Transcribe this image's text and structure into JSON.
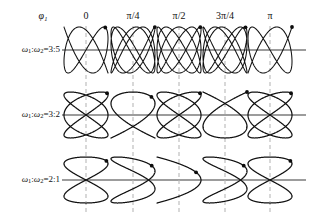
{
  "plate": {
    "title": "Lissajous figures for varying frequency ratio and phase",
    "width": 314,
    "height": 218,
    "background": "#ffffff",
    "curve_color": "#111111",
    "axis_color": "#3b3b3b",
    "dash_color": "#b9b9b9"
  },
  "header": {
    "phase_symbol": "φ",
    "phase_subscript": "1",
    "columns": [
      {
        "label": "0",
        "phase_rad": 0.0
      },
      {
        "label": "π/4",
        "phase_rad": 0.7853981634
      },
      {
        "label": "π/2",
        "phase_rad": 1.5707963268
      },
      {
        "label": "3π/4",
        "phase_rad": 2.3561944902
      },
      {
        "label": "π",
        "phase_rad": 3.1415926536
      }
    ]
  },
  "rows": [
    {
      "omega_symbol": "ω",
      "sub1": "1",
      "sep": ":",
      "sub2": "2",
      "eq": "=",
      "ratio_label": "3:5",
      "ratio": [
        3,
        5
      ],
      "label_full": "ω₁:ω₂=3:5"
    },
    {
      "omega_symbol": "ω",
      "sub1": "1",
      "sep": ":",
      "sub2": "2",
      "eq": "=",
      "ratio_label": "3:2",
      "ratio": [
        3,
        2
      ],
      "label_full": "ω₁:ω₂=3:2"
    },
    {
      "omega_symbol": "ω",
      "sub1": "1",
      "sep": ":",
      "sub2": "2",
      "eq": "=",
      "ratio_label": "2:1",
      "ratio": [
        2,
        1
      ],
      "label_full": "ω₁:ω₂=2:1"
    }
  ],
  "chart_data": {
    "type": "line",
    "xlabel": "φ₁",
    "ylabel": "ω₁:ω₂",
    "grid": false,
    "legend": "none",
    "parametric": {
      "x": "A·sin(ω₁ t + φ₁)",
      "y": "B·sin(ω₂ t)",
      "t_range": [
        0,
        6.283185307
      ]
    },
    "columns": [
      "0",
      "π/4",
      "π/2",
      "3π/4",
      "π"
    ],
    "column_phases": [
      0.0,
      0.7853981634,
      1.5707963268,
      2.3561944902,
      3.1415926536
    ],
    "row_ratios": [
      "3:5",
      "3:2",
      "2:1"
    ],
    "cells": [
      {
        "row": "3:5",
        "col": "0",
        "wx": 3,
        "wy": 5,
        "phase": 0.0,
        "start_marker": true
      },
      {
        "row": "3:5",
        "col": "π/4",
        "wx": 3,
        "wy": 5,
        "phase": 0.7853981634,
        "start_marker": true
      },
      {
        "row": "3:5",
        "col": "π/2",
        "wx": 3,
        "wy": 5,
        "phase": 1.5707963268,
        "start_marker": true
      },
      {
        "row": "3:5",
        "col": "3π/4",
        "wx": 3,
        "wy": 5,
        "phase": 2.3561944902,
        "start_marker": true
      },
      {
        "row": "3:5",
        "col": "π",
        "wx": 3,
        "wy": 5,
        "phase": 3.1415926536,
        "start_marker": true
      },
      {
        "row": "3:2",
        "col": "0",
        "wx": 3,
        "wy": 2,
        "phase": 0.0,
        "start_marker": true
      },
      {
        "row": "3:2",
        "col": "π/4",
        "wx": 3,
        "wy": 2,
        "phase": 0.7853981634,
        "start_marker": true
      },
      {
        "row": "3:2",
        "col": "π/2",
        "wx": 3,
        "wy": 2,
        "phase": 1.5707963268,
        "start_marker": true
      },
      {
        "row": "3:2",
        "col": "3π/4",
        "wx": 3,
        "wy": 2,
        "phase": 2.3561944902,
        "start_marker": true
      },
      {
        "row": "3:2",
        "col": "π",
        "wx": 3,
        "wy": 2,
        "phase": 3.1415926536,
        "start_marker": true
      },
      {
        "row": "2:1",
        "col": "0",
        "wx": 2,
        "wy": 1,
        "phase": 0.0,
        "start_marker": true
      },
      {
        "row": "2:1",
        "col": "π/4",
        "wx": 2,
        "wy": 1,
        "phase": 0.7853981634,
        "start_marker": true
      },
      {
        "row": "2:1",
        "col": "π/2",
        "wx": 2,
        "wy": 1,
        "phase": 1.5707963268,
        "start_marker": true
      },
      {
        "row": "2:1",
        "col": "3π/4",
        "wx": 2,
        "wy": 1,
        "phase": 2.3561944902,
        "start_marker": true
      },
      {
        "row": "2:1",
        "col": "π",
        "wx": 2,
        "wy": 1,
        "phase": 3.1415926536,
        "start_marker": true
      }
    ]
  },
  "layout": {
    "header_y": 17,
    "phi_x": 43,
    "column_centers": [
      86,
      133,
      179,
      225,
      270
    ],
    "row_axis_y": [
      50,
      115,
      180
    ],
    "axis_x_start": 62,
    "axis_x_end": 306,
    "row_label_x": 60,
    "dash_top": [
      26,
      91,
      156
    ],
    "dash_bottom": [
      90,
      155,
      214
    ],
    "cell_half_width": 22,
    "amp_x": [
      22,
      22,
      22
    ],
    "amp_y": [
      23,
      23,
      23
    ]
  }
}
